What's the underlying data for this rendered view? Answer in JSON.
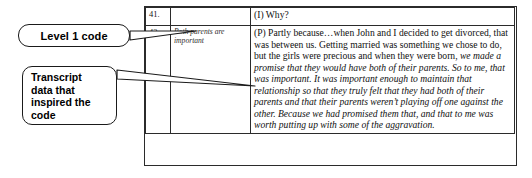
{
  "figure": {
    "kind": "annotated-qualitative-coding-table"
  },
  "callouts": [
    {
      "id": "level-1-code",
      "lines": [
        "Level 1 code"
      ]
    },
    {
      "id": "transcript-data",
      "lines": [
        "Transcript",
        "data that",
        "inspired the",
        "code"
      ]
    }
  ],
  "table": {
    "columns": [
      "line_number",
      "code",
      "transcript"
    ],
    "rows": [
      {
        "line_number": "41.",
        "code": "",
        "transcript_runs": [
          {
            "text": "(I)  Why?",
            "italic": false
          }
        ]
      },
      {
        "line_number": "42.",
        "code": "Both parents are important",
        "transcript_runs": [
          {
            "text": "(P) Partly because…when John and I decided to get divorced, that was between us.  Getting married was something we chose to do, but the girls were precious and when they were born, ",
            "italic": false
          },
          {
            "text": "we made a promise that they would have both of their parents.  So to me, that was important.  It was important enough to maintain that relationship so that they truly felt that they had both of their parents and that their parents weren’t playing off one against the other.  Because we had promised them that, and that to me was worth putting up with some of the aggravation.",
            "italic": true
          }
        ]
      }
    ]
  },
  "colors": {
    "border": "#2b2b2b",
    "text": "#101010",
    "code_text": "#2f2f2f",
    "background": "#ffffff"
  }
}
